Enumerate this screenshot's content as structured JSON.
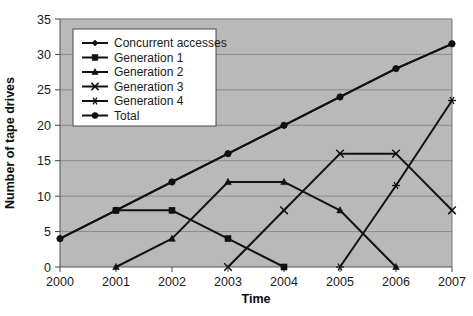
{
  "chart_data": {
    "type": "line",
    "title": "",
    "xlabel": "Time",
    "ylabel": "Number of tape drives",
    "categories": [
      "2000",
      "2001",
      "2002",
      "2003",
      "2004",
      "2005",
      "2006",
      "2007"
    ],
    "x": [
      2000,
      2001,
      2002,
      2003,
      2004,
      2005,
      2006,
      2007
    ],
    "xlim": [
      2000,
      2007
    ],
    "ylim": [
      0,
      35
    ],
    "yticks": [
      0,
      5,
      10,
      15,
      20,
      25,
      30,
      35
    ],
    "ytick_labels": [
      "0",
      "5",
      "10",
      "15",
      "20",
      "25",
      "30",
      "35"
    ],
    "grid": "horizontal",
    "legend_position": "upper-left-inside",
    "plot_background": "#b9b9b9",
    "figure_background": "#ffffff",
    "line_color": "#111111",
    "grid_color": "#8a8a8a",
    "series": [
      {
        "name": "Concurrent accesses",
        "marker": "diamond",
        "values": [
          4,
          8,
          12,
          16,
          20,
          24,
          28,
          31.5
        ]
      },
      {
        "name": "Generation 1",
        "marker": "square",
        "values": [
          null,
          8,
          8,
          4,
          0,
          null,
          null,
          null
        ]
      },
      {
        "name": "Generation 2",
        "marker": "triangle",
        "values": [
          null,
          0,
          4,
          12,
          12,
          8,
          0,
          null
        ]
      },
      {
        "name": "Generation 3",
        "marker": "cross",
        "values": [
          null,
          null,
          null,
          0,
          8,
          16,
          16,
          8
        ]
      },
      {
        "name": "Generation 4",
        "marker": "asterisk",
        "values": [
          null,
          null,
          null,
          null,
          null,
          0,
          11.5,
          23.5
        ]
      },
      {
        "name": "Total",
        "marker": "circle",
        "values": [
          4,
          8,
          12,
          16,
          20,
          24,
          28,
          31.5
        ]
      }
    ]
  },
  "legend": {
    "items": [
      {
        "label": "Concurrent accesses",
        "marker": "diamond"
      },
      {
        "label": "Generation 1",
        "marker": "square"
      },
      {
        "label": "Generation 2",
        "marker": "triangle"
      },
      {
        "label": "Generation 3",
        "marker": "cross"
      },
      {
        "label": "Generation 4",
        "marker": "asterisk"
      },
      {
        "label": "Total",
        "marker": "circle"
      }
    ]
  },
  "axes": {
    "y_title": "Number of tape drives",
    "x_title": "Time",
    "y_tick_labels": [
      "35",
      "30",
      "25",
      "20",
      "15",
      "10",
      "5",
      "0"
    ],
    "x_tick_labels": [
      "2000",
      "2001",
      "2002",
      "2003",
      "2004",
      "2005",
      "2006",
      "2007"
    ]
  }
}
